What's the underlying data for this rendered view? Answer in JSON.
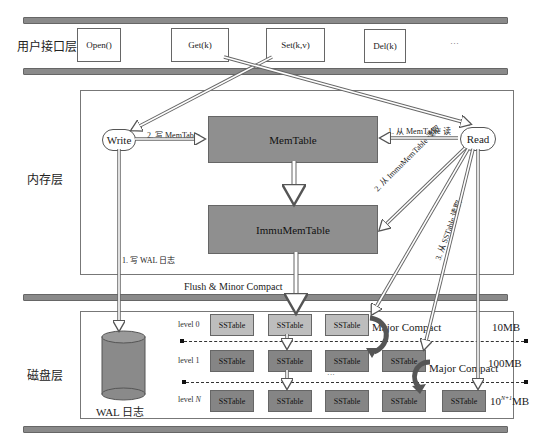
{
  "layers": {
    "api": {
      "label": "用户接口层"
    },
    "memory": {
      "label": "内存层"
    },
    "disk": {
      "label": "磁盘层"
    }
  },
  "api_calls": [
    {
      "label": "Open()"
    },
    {
      "label": "Get(k)"
    },
    {
      "label": "Set(k,v)"
    },
    {
      "label": "Del(k)"
    },
    {
      "label": "···"
    }
  ],
  "memory": {
    "write_label": "Write",
    "read_label": "Read",
    "memtable_label": "MemTable",
    "immutable_label": "ImmuMemTable",
    "write_memtable_note": "2. 写 MemTable",
    "read_memtable_note": "1. 从 MemTable 读",
    "read_immu_note": "2. 从 ImmuMemTable 读取",
    "read_sstable_note": "3. 从 SSTable 读取",
    "write_wal_note": "1. 写 WAL 日志",
    "flush_note": "Flush & Minor Compact"
  },
  "disk": {
    "wal_label": "WAL 日志",
    "levels": [
      {
        "label": "level 0",
        "size": "10MB",
        "tables": [
          "SSTable",
          "SSTable",
          "SSTable"
        ]
      },
      {
        "label": "level 1",
        "size": "100MB",
        "tables": [
          "SSTable",
          "SSTable",
          "SSTable",
          "SSTable"
        ]
      },
      {
        "label": "level N",
        "size_base": "10",
        "size_exp": "N+1",
        "size_unit": "MB",
        "tables": [
          "SSTable",
          "SSTable",
          "SSTable",
          "SSTable",
          "SSTable"
        ]
      }
    ],
    "ellipsis": "···",
    "major_compact_1": "Major Compact",
    "major_compact_2": "Major Compact"
  },
  "colors": {
    "bar": "#8a8a8a",
    "memtable": "#8f8f8f",
    "sstable_level0": "#bdbdbd",
    "sstable_deeper": "#858585",
    "compact_arrow": "#555555"
  }
}
